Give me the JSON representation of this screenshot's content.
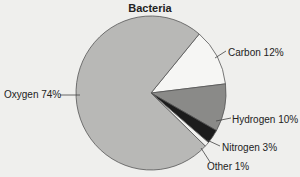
{
  "chart_data": {
    "type": "pie",
    "title": "Bacteria",
    "categories": [
      "Oxygen",
      "Carbon",
      "Hydrogen",
      "Nitrogen",
      "Other"
    ],
    "values": [
      74,
      12,
      10,
      3,
      1
    ],
    "unit": "%",
    "labels": [
      "Oxygen  74%",
      "Carbon  12%",
      "Hydrogen  10%",
      "Nitrogen  3%",
      "Other  1%"
    ],
    "colors": {
      "Oxygen": "#b8b8b6",
      "Carbon": "#f6f6f4",
      "Hydrogen": "#8a8a88",
      "Nitrogen": "#1c1c1c",
      "Other": "#f2f2f0"
    },
    "legend": "none (callout labels)"
  }
}
